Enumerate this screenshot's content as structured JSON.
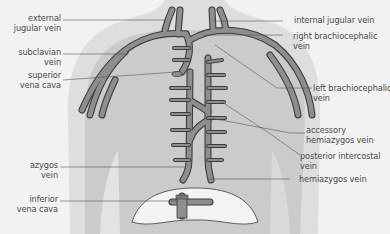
{
  "diagram": {
    "type": "anatomical-illustration",
    "colors": {
      "background": "#f2f2f2",
      "body_silhouette": "#dcdcdc",
      "lung_region": "#c8c8c8",
      "vein_fill": "#8c8c8c",
      "vein_outline": "#3c3c3c",
      "diaphragm": "#f4f4f4",
      "leader_line": "#555555",
      "text": "#4a4a4a"
    },
    "labels_left": [
      {
        "id": "external-jugular-vein",
        "text": "external\njugular vein"
      },
      {
        "id": "subclavian-vein",
        "text": "subclavian\nvein"
      },
      {
        "id": "superior-vena-cava",
        "text": "superior\nvena cava"
      },
      {
        "id": "azygos-vein",
        "text": "azygos\nvein"
      },
      {
        "id": "inferior-vena-cava",
        "text": "inferior\nvena cava"
      }
    ],
    "labels_right": [
      {
        "id": "internal-jugular-vein",
        "text": "internal jugular vein"
      },
      {
        "id": "right-brachiocephalic-vein",
        "text": "right brachiocephalic\nvein"
      },
      {
        "id": "left-brachiocephalic-vein",
        "text": "left brachiocephalic\nvein"
      },
      {
        "id": "accessory-hemiazygos-vein",
        "text": "accessory\nhemiazygos vein"
      },
      {
        "id": "posterior-intercostal-vein",
        "text": "posterior intercostal\nvein"
      },
      {
        "id": "hemiazygos-vein",
        "text": "hemiazygos vein"
      }
    ]
  }
}
